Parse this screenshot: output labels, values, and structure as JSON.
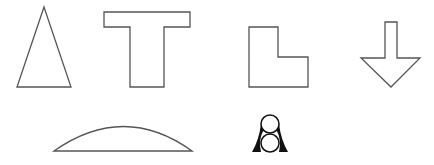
{
  "canvas": {
    "width": 434,
    "height": 165,
    "background": "#ffffff",
    "stroke": "#555555"
  },
  "shapes": [
    {
      "id": "triangle",
      "label": "isosceles triangle"
    },
    {
      "id": "t-shape",
      "label": "T shape"
    },
    {
      "id": "l-shape",
      "label": "L shape"
    },
    {
      "id": "down-arrow",
      "label": "down arrow"
    },
    {
      "id": "circular-segment",
      "label": "circular segment"
    },
    {
      "id": "two-circles-figure",
      "label": "two stacked circles with flared sides"
    }
  ]
}
